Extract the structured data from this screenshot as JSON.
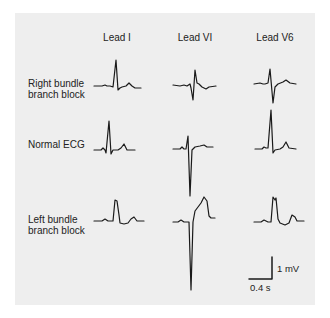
{
  "figure": {
    "columns": [
      {
        "label": "Lead I",
        "x": 117
      },
      {
        "label": "Lead VI",
        "x": 195
      },
      {
        "label": "Lead V6",
        "x": 275
      }
    ],
    "rows": [
      {
        "label_line1": "Right bundle",
        "label_line2": "branch block",
        "top": 78
      },
      {
        "label_line1": "Normal ECG",
        "label_line2": "",
        "top": 139
      },
      {
        "label_line1": "Left bundle",
        "label_line2": "branch block",
        "top": 214
      }
    ],
    "scale_bar": {
      "voltage_label": "1 mV",
      "time_label": "0.4 s"
    },
    "colors": {
      "background": "#ffffff",
      "panel": "#eeeeee",
      "trace": "#1a1a1a"
    }
  }
}
